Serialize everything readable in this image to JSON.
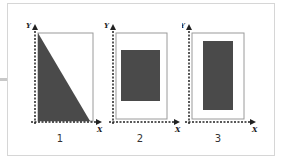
{
  "figure": {
    "panels": [
      {
        "id": 1,
        "caption": "1",
        "x_label": "X",
        "y_label": "Y",
        "shape": "right-triangle",
        "fill": "#4a4a4a"
      },
      {
        "id": 2,
        "caption": "2",
        "x_label": "X",
        "y_label": "Y",
        "shape": "rectangle",
        "fill": "#4a4a4a"
      },
      {
        "id": 3,
        "caption": "3",
        "x_label": "X",
        "y_label": "Y",
        "shape": "tall-rectangle",
        "fill": "#4a4a4a"
      }
    ],
    "colors": {
      "shape_fill": "#4a4a4a",
      "box_border": "#9a9a9a",
      "axis": "#222222",
      "frame_border": "#d6d6d6"
    }
  }
}
